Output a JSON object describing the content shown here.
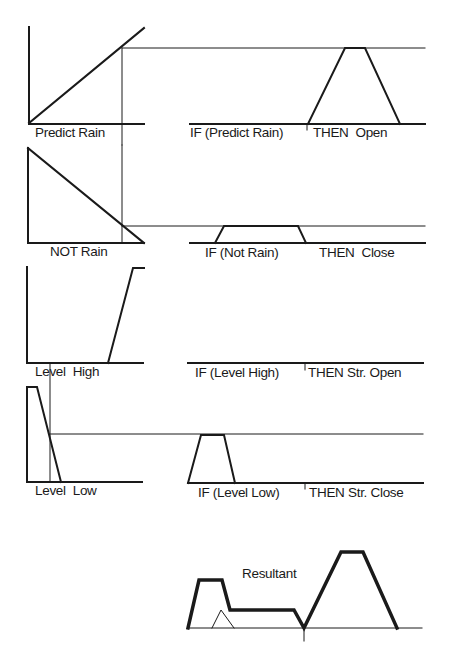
{
  "diagram": {
    "colors": {
      "line": "#1a1a1a",
      "background": "#ffffff"
    },
    "inputs": [
      {
        "label": "Predict Rain"
      },
      {
        "label": "NOT Rain"
      },
      {
        "label": "Level  High"
      },
      {
        "label": "Level  Low"
      }
    ],
    "rules": [
      {
        "if_part": "IF (Predict Rain)",
        "then_part": "THEN  Open"
      },
      {
        "if_part": "IF (Not Rain)",
        "then_part": "THEN  Close"
      },
      {
        "if_part": "IF (Level High)",
        "then_part": "THEN Str. Open"
      },
      {
        "if_part": "IF (Level Low)",
        "then_part": "THEN Str. Close"
      }
    ],
    "resultant": {
      "label": "Resultant"
    }
  }
}
